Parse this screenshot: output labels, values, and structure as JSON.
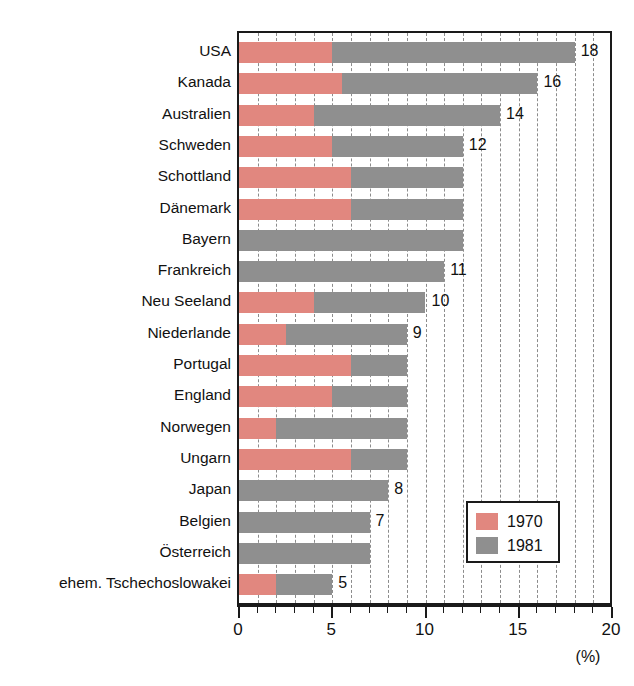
{
  "chart_data": {
    "type": "bar",
    "orientation": "horizontal",
    "stacked": false,
    "title": "",
    "subtitle": "",
    "xlabel": "(%)",
    "ylabel": "",
    "xlim": [
      0,
      20
    ],
    "xticks": [
      0,
      5,
      10,
      15,
      20
    ],
    "xtick_labels": [
      "0",
      "5",
      "10",
      "15",
      "20"
    ],
    "minor_tick_step": 1,
    "grid": true,
    "grid_style": "dashed-vertical",
    "legend_position": "inside-lower-right",
    "categories": [
      "USA",
      "Kanada",
      "Australien",
      "Schweden",
      "Schottland",
      "Dänemark",
      "Bayern",
      "Frankreich",
      "Neu Seeland",
      "Niederlande",
      "Portugal",
      "England",
      "Norwegen",
      "Ungarn",
      "Japan",
      "Belgien",
      "Österreich",
      "ehem. Tschechoslowakei"
    ],
    "series": [
      {
        "name": "1970",
        "color": "#e1877f",
        "values": [
          5,
          5.5,
          4,
          5,
          6,
          6,
          0,
          0,
          4,
          2.5,
          6,
          5,
          2,
          6,
          0,
          0,
          0,
          2
        ]
      },
      {
        "name": "1981",
        "color": "#8f8f8f",
        "values": [
          18,
          16,
          14,
          12,
          12,
          12,
          12,
          11,
          10,
          9,
          9,
          9,
          9,
          9,
          8,
          7,
          7,
          5
        ]
      }
    ],
    "value_labels": [
      "18",
      "16",
      "14",
      "12",
      "",
      "",
      "",
      "11",
      "10",
      "9",
      "",
      "",
      "",
      "",
      "8",
      "7",
      "",
      "5"
    ],
    "annotations": []
  },
  "legend": {
    "items": [
      {
        "label": "1970",
        "color": "#e1877f"
      },
      {
        "label": "1981",
        "color": "#8f8f8f"
      }
    ]
  },
  "axis": {
    "unit": "(%)"
  },
  "colors": {
    "series_1970": "#e1877f",
    "series_1981": "#8f8f8f",
    "axis": "#1a1a1a",
    "grid": "#8c8c8c",
    "background": "#ffffff"
  }
}
